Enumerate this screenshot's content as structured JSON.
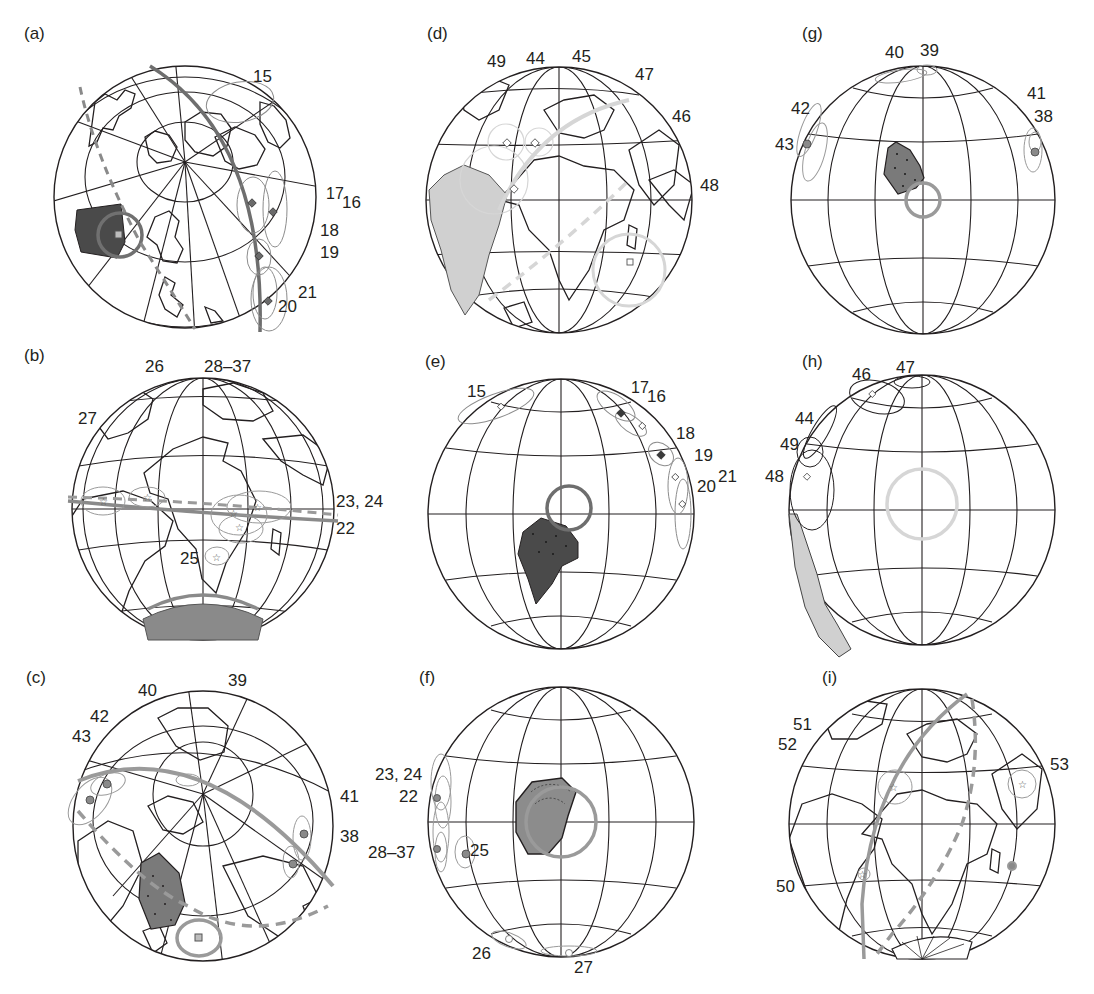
{
  "figure": {
    "panels": [
      {
        "letter": "(a)",
        "view": "north-polar oblique",
        "labels": [
          "15",
          "17",
          "16",
          "18",
          "19",
          "20",
          "21"
        ],
        "features": [
          "dark highlighted craton (west)",
          "confidence circle",
          "thick solid great circle",
          "dashed great circle",
          "diamond poles with error ellipses"
        ]
      },
      {
        "letter": "(b)",
        "view": "Atlantic-centred",
        "labels": [
          "26",
          "28–37",
          "27",
          "23, 24",
          "22",
          "25"
        ],
        "features": [
          "equatorial solid band",
          "equatorial dashed band",
          "star poles with ellipses",
          "Antarctica block (grey, hatched)"
        ]
      },
      {
        "letter": "(c)",
        "view": "polar oblique",
        "labels": [
          "40",
          "39",
          "42",
          "43",
          "41",
          "38"
        ],
        "features": [
          "dotted dark block",
          "solid grey great circle",
          "dashed grey great circle",
          "circle poles with ellipses",
          "square pole with confidence circle"
        ]
      },
      {
        "letter": "(d)",
        "view": "Atlantic-centred",
        "labels": [
          "49",
          "44",
          "45",
          "47",
          "46",
          "48"
        ],
        "features": [
          "light grey South America",
          "light grey great circle",
          "diamond poles",
          "square pole with circle"
        ]
      },
      {
        "letter": "(e)",
        "view": "graticule only",
        "labels": [
          "15",
          "17",
          "16",
          "18",
          "19",
          "20",
          "21"
        ],
        "features": [
          "dark dotted block",
          "dark confidence circle",
          "diamond poles with ellipses at limb"
        ]
      },
      {
        "letter": "(f)",
        "view": "graticule only",
        "labels": [
          "23, 24",
          "22",
          "28–37",
          "25",
          "26",
          "27"
        ],
        "features": [
          "grey hatched block",
          "grey confidence circle",
          "circle poles with ellipses"
        ]
      },
      {
        "letter": "(g)",
        "view": "graticule only",
        "labels": [
          "40",
          "39",
          "41",
          "38",
          "42",
          "43"
        ],
        "features": [
          "dark dotted block",
          "grey confidence circle",
          "circle poles with ellipses"
        ]
      },
      {
        "letter": "(h)",
        "view": "graticule only",
        "labels": [
          "46",
          "47",
          "44",
          "49",
          "48"
        ],
        "features": [
          "light grey South American margin",
          "light grey confidence circle",
          "diamond poles with ellipses"
        ]
      },
      {
        "letter": "(i)",
        "view": "Atlantic-centred",
        "labels": [
          "51",
          "52",
          "53",
          "50"
        ],
        "features": [
          "solid grey great circle",
          "dashed grey great circle",
          "star poles with circles",
          "Antarctica block (hatched)"
        ]
      }
    ],
    "colors": {
      "ink": "#231f20",
      "dark_block": "#4a4a4a",
      "mid_grey": "#8c8c8c",
      "light_grey": "#d6d6d6",
      "ellipse": "#9a9a9a"
    }
  }
}
